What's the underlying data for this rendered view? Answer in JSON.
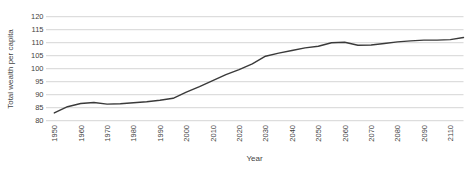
{
  "chart_data": {
    "type": "line",
    "title": "",
    "xlabel": "Year",
    "ylabel": "Total wealth per capita",
    "ylim": [
      80,
      120
    ],
    "y_ticks": [
      80,
      85,
      90,
      95,
      100,
      105,
      110,
      115,
      120
    ],
    "x_tick_labels": [
      "1950",
      "1960",
      "1970",
      "1980",
      "1990",
      "2000",
      "2010",
      "2020",
      "2030",
      "2040",
      "2050",
      "2060",
      "2070",
      "2080",
      "2090",
      "2110"
    ],
    "grid": "horizontal gridlines only, no axis spines, no legend",
    "series": [
      {
        "name": "Total wealth per capita",
        "x": [
          1950,
          1955,
          1960,
          1965,
          1970,
          1975,
          1980,
          1985,
          1990,
          1995,
          2000,
          2005,
          2010,
          2015,
          2020,
          2025,
          2030,
          2035,
          2040,
          2045,
          2050,
          2055,
          2060,
          2065,
          2070,
          2075,
          2080,
          2085,
          2090,
          2100,
          2110,
          2115
        ],
        "values": [
          83.0,
          85.4,
          86.6,
          87.0,
          86.4,
          86.5,
          86.9,
          87.3,
          87.9,
          88.6,
          91.0,
          93.1,
          95.4,
          97.7,
          99.6,
          101.9,
          104.8,
          106.0,
          107.0,
          108.0,
          108.6,
          110.0,
          110.2,
          109.0,
          109.1,
          109.7,
          110.3,
          110.7,
          111.0,
          111.0,
          111.2,
          112.0
        ]
      }
    ],
    "colors": {
      "line": "#3a3a3a",
      "grid": "#c9c9c9",
      "text": "#3f3f3f",
      "background": "#ffffff"
    }
  }
}
